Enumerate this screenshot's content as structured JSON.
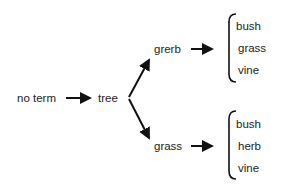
{
  "diagram": {
    "root": "no term",
    "middle": "tree",
    "branches": [
      {
        "label": "grerb",
        "options": [
          "bush",
          "grass",
          "vine"
        ]
      },
      {
        "label": "grass",
        "options": [
          "bush",
          "herb",
          "vine"
        ]
      }
    ],
    "colors": {
      "text": "#1c1c1c",
      "arrow": "#111111",
      "background": "#ffffff"
    }
  }
}
